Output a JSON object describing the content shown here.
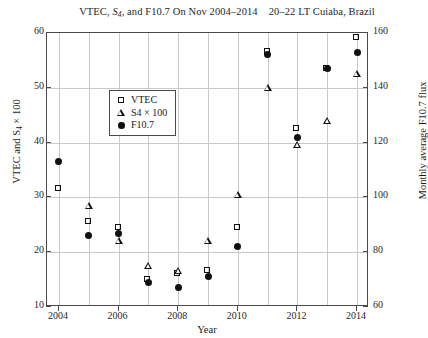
{
  "chart_data": {
    "type": "scatter",
    "title_part1": "VTEC, ",
    "title_s": "S",
    "title_s_sub": "4",
    "title_part2": ", and F10.7 On Nov 2004–2014",
    "title_part3": "20–22 LT Cuiaba, Brazil",
    "xlabel": "Year",
    "ylabel": "VTEC and S",
    "ylabel_sub": "4",
    "ylabel_tail": " × 100",
    "ylabel_right": "Monthly average F10.7 flux",
    "x": [
      2004,
      2005,
      2006,
      2007,
      2008,
      2009,
      2010,
      2011,
      2012,
      2013,
      2014
    ],
    "xlim": [
      2003.6,
      2014.4
    ],
    "ylim": [
      10,
      60
    ],
    "ylim_right": [
      60,
      160
    ],
    "xticks": [
      2004,
      2006,
      2008,
      2010,
      2012,
      2014
    ],
    "xticklabels": [
      "2004",
      "2006",
      "2008",
      "2010",
      "2012",
      "2014"
    ],
    "xticks_minor": [
      2005,
      2007,
      2009,
      2011,
      2013
    ],
    "yticks": [
      10,
      20,
      30,
      40,
      50,
      60
    ],
    "yticklabels": [
      "10",
      "20",
      "30",
      "40",
      "50",
      "60"
    ],
    "yticks_right": [
      60,
      80,
      100,
      120,
      140,
      160
    ],
    "yticklabels_right": [
      "60",
      "80",
      "100",
      "120",
      "140",
      "160"
    ],
    "grid": true,
    "legend_position": "upper left",
    "series": [
      {
        "name": "VTEC",
        "marker": "open-square",
        "axis": "left",
        "x": [
          2004,
          2005,
          2006,
          2007,
          2008,
          2009,
          2010,
          2011,
          2012,
          2013,
          2014
        ],
        "values": [
          31.5,
          25.5,
          24.5,
          15.0,
          16.0,
          16.5,
          24.5,
          56.5,
          42.5,
          53.5,
          59.0
        ]
      },
      {
        "name": "S4 × 100",
        "marker": "open-triangle",
        "axis": "left",
        "x": [
          2005,
          2006,
          2007,
          2008,
          2009,
          2010,
          2011,
          2012,
          2013,
          2014
        ],
        "values": [
          28.5,
          22.0,
          17.5,
          16.5,
          22.0,
          30.5,
          50.0,
          39.5,
          44.0,
          52.5
        ]
      },
      {
        "name": "F10.7",
        "marker": "filled-circle",
        "axis": "right",
        "x": [
          2004,
          2005,
          2006,
          2007,
          2008,
          2009,
          2010,
          2011,
          2012,
          2013,
          2014
        ],
        "values": [
          113,
          86,
          87,
          69,
          67,
          71,
          82,
          152,
          122,
          147,
          153
        ],
        "values_left_scale": [
          36.5,
          23.0,
          23.5,
          14.5,
          13.5,
          15.5,
          21.0,
          56.0,
          41.0,
          53.5,
          56.5
        ]
      }
    ]
  },
  "legend": {
    "items": [
      {
        "label": "VTEC",
        "glyph": "open-square"
      },
      {
        "label": "S4 × 100",
        "glyph": "open-triangle"
      },
      {
        "label": "F10.7",
        "glyph": "filled-circle"
      }
    ]
  },
  "colors": {
    "axis": "#4a4a4a",
    "grid": "#c9c9c9",
    "marker": "#111111",
    "background": "#ffffff"
  }
}
